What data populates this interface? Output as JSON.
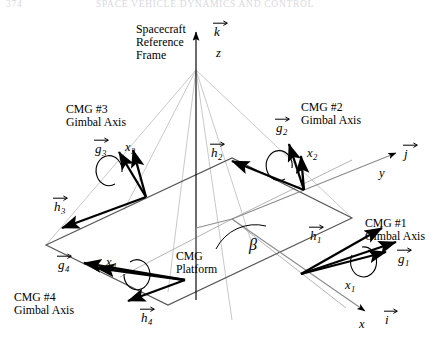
{
  "page": {
    "running_head_number": "374",
    "running_head_title": "SPACE VEHICLE DYNAMICS AND CONTROL"
  },
  "figure": {
    "reference_frame": {
      "line1": "Spacecraft",
      "line2": "Reference",
      "line3": "Frame",
      "unit_vector_k": "k",
      "axis_z": "z"
    },
    "axes": {
      "unit_vector_i": "i",
      "axis_x": "x",
      "unit_vector_j": "j",
      "axis_y": "y"
    },
    "platform": {
      "line1": "CMG",
      "line2": "Platform"
    },
    "skew_angle": "β",
    "cmgs": [
      {
        "id": "cmg1",
        "title_line1": "CMG #1",
        "title_line2": "Gimbal Axis",
        "gimbal_vector": "g",
        "gimbal_sub": "1",
        "momentum_vector": "h",
        "momentum_sub": "1",
        "body_axis": "x",
        "body_axis_sub": "1"
      },
      {
        "id": "cmg2",
        "title_line1": "CMG #2",
        "title_line2": "Gimbal Axis",
        "gimbal_vector": "g",
        "gimbal_sub": "2",
        "momentum_vector": "h",
        "momentum_sub": "2",
        "body_axis": "x",
        "body_axis_sub": "2"
      },
      {
        "id": "cmg3",
        "title_line1": "CMG #3",
        "title_line2": "Gimbal Axis",
        "gimbal_vector": "g",
        "gimbal_sub": "3",
        "momentum_vector": "h",
        "momentum_sub": "3",
        "body_axis": "x",
        "body_axis_sub": "3"
      },
      {
        "id": "cmg4",
        "title_line1": "CMG #4",
        "title_line2": "Gimbal Axis",
        "gimbal_vector": "g",
        "gimbal_sub": "4",
        "momentum_vector": "h",
        "momentum_sub": "4",
        "body_axis": "x",
        "body_axis_sub": "4"
      }
    ],
    "colors": {
      "ink": "#000000",
      "construction_line": "#c9c9c9",
      "platform_edge": "#6b6b6b",
      "running_head": "#d9d9e0"
    }
  }
}
